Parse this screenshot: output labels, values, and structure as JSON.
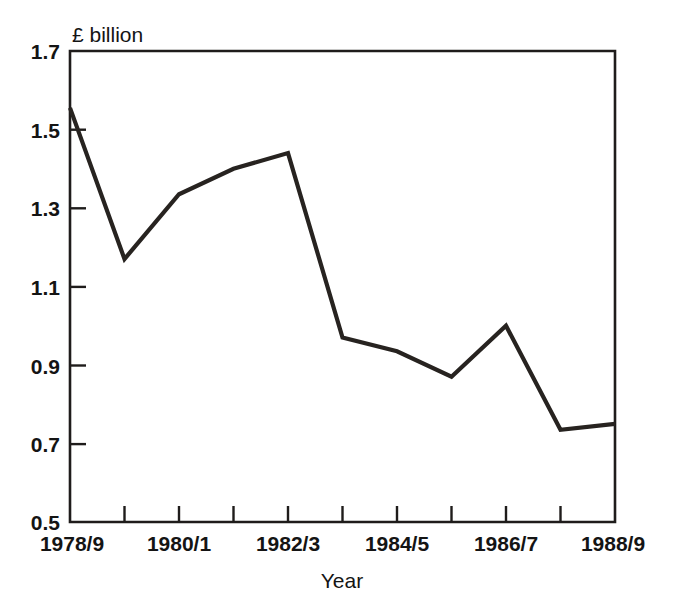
{
  "chart_data": {
    "type": "line",
    "title": "",
    "subtitle": "",
    "xlabel": "Year",
    "ylabel": "",
    "unit_label": "£ billion",
    "categories": [
      "1978/9",
      "1979/80",
      "1980/1",
      "1981/2",
      "1982/3",
      "1983/4",
      "1984/5",
      "1985/6",
      "1986/7",
      "1987/8",
      "1988/9"
    ],
    "values": [
      1.555,
      1.17,
      1.335,
      1.4,
      1.44,
      0.97,
      0.935,
      0.87,
      1.0,
      0.735,
      0.75
    ],
    "series": [
      {
        "name": "£ billion",
        "values": [
          1.555,
          1.17,
          1.335,
          1.4,
          1.44,
          0.97,
          0.935,
          0.87,
          1.0,
          0.735,
          0.75
        ]
      }
    ],
    "ylim": [
      0.5,
      1.7
    ],
    "ytick_values": [
      1.7,
      1.5,
      1.3,
      1.1,
      0.9,
      0.7,
      0.5
    ],
    "ytick_labels": [
      "1.7",
      "1.5",
      "1.3",
      "1.1",
      "0.9",
      "0.7",
      "0.5"
    ],
    "xtick_labels_shown": [
      "1978/9",
      "",
      "1980/1",
      "",
      "1982/3",
      "",
      "1984/5",
      "",
      "1986/7",
      "",
      "1988/9"
    ],
    "xtick_count": 11,
    "grid": false,
    "legend": false,
    "legend_position": "none",
    "line_color": "#272320",
    "axis_color": "#1f1c1b",
    "background_color": "#ffffff"
  },
  "labels": {
    "unit": "£ billion",
    "x_axis_title": "Year",
    "y_0": "1.7",
    "y_1": "1.5",
    "y_2": "1.3",
    "y_3": "1.1",
    "y_4": "0.9",
    "y_5": "0.7",
    "y_6": "0.5",
    "x_0": "1978/9",
    "x_2": "1980/1",
    "x_4": "1982/3",
    "x_6": "1984/5",
    "x_8": "1986/7",
    "x_10": "1988/9"
  }
}
